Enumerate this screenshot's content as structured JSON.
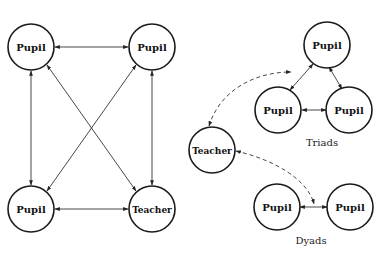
{
  "diagram": {
    "left_group": {
      "nodes": [
        {
          "id": "p1",
          "label": "Pupil"
        },
        {
          "id": "p2",
          "label": "Pupil"
        },
        {
          "id": "p3",
          "label": "Pupil"
        },
        {
          "id": "t1",
          "label": "Teacher"
        }
      ],
      "edges": [
        {
          "from": "p1",
          "to": "p2",
          "type": "bidirectional"
        },
        {
          "from": "p1",
          "to": "p3",
          "type": "bidirectional"
        },
        {
          "from": "p2",
          "to": "t1",
          "type": "bidirectional"
        },
        {
          "from": "p3",
          "to": "t1",
          "type": "bidirectional"
        },
        {
          "from": "p1",
          "to": "t1",
          "type": "bidirectional"
        },
        {
          "from": "p2",
          "to": "p3",
          "type": "bidirectional"
        }
      ]
    },
    "right_group": {
      "teacher": {
        "id": "t2",
        "label": "Teacher"
      },
      "triads": {
        "caption": "Triads",
        "nodes": [
          {
            "id": "tp1",
            "label": "Pupil"
          },
          {
            "id": "tp2",
            "label": "Pupil"
          },
          {
            "id": "tp3",
            "label": "Pupil"
          }
        ],
        "edges": [
          {
            "from": "tp1",
            "to": "tp2",
            "type": "bidirectional"
          },
          {
            "from": "tp1",
            "to": "tp3",
            "type": "bidirectional"
          },
          {
            "from": "tp2",
            "to": "tp3",
            "type": "bidirectional"
          }
        ]
      },
      "dyads": {
        "caption": "Dyads",
        "nodes": [
          {
            "id": "dp1",
            "label": "Pupil"
          },
          {
            "id": "dp2",
            "label": "Pupil"
          }
        ],
        "edges": [
          {
            "from": "dp1",
            "to": "dp2",
            "type": "bidirectional"
          }
        ]
      },
      "dashed_edges": [
        {
          "from": "t2",
          "to": "triads",
          "type": "dashed-bidirectional"
        },
        {
          "from": "t2",
          "to": "dyads",
          "type": "dashed-bidirectional"
        }
      ]
    }
  }
}
